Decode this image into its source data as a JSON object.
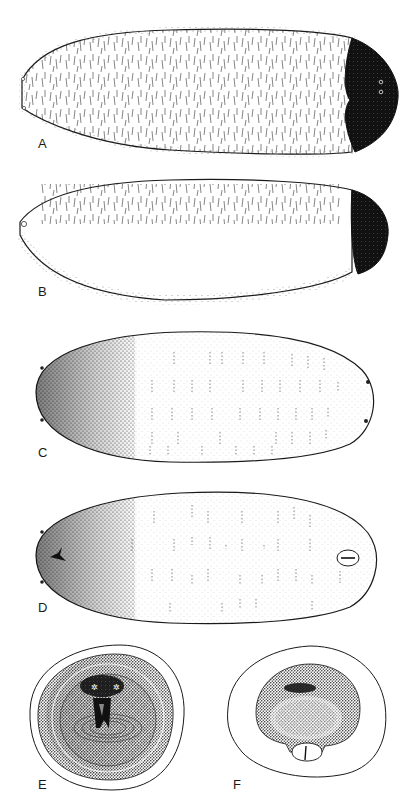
{
  "figure": {
    "panels": [
      {
        "id": "A",
        "label": "A",
        "description": "larva lateral view, hairy body, dark posterior cap with two spiracles"
      },
      {
        "id": "B",
        "label": "B",
        "description": "larva lateral view, hairy body, dark posterior cap, anterior mouth opening"
      },
      {
        "id": "C",
        "label": "C",
        "description": "larva dorsal view, stippled anterior, segmental dash rows"
      },
      {
        "id": "D",
        "label": "D",
        "description": "larva ventral view, stippled anterior with mouth hook, posterior oval opening"
      },
      {
        "id": "E",
        "label": "E",
        "description": "anterior end-on view, concentric stippled rings, central mouthparts"
      },
      {
        "id": "F",
        "label": "F",
        "description": "posterior end-on view, dark stippled disc with lower opening"
      }
    ]
  },
  "colors": {
    "ink": "#1a1a1a",
    "paper": "#ffffff",
    "stipple": "#333333"
  }
}
